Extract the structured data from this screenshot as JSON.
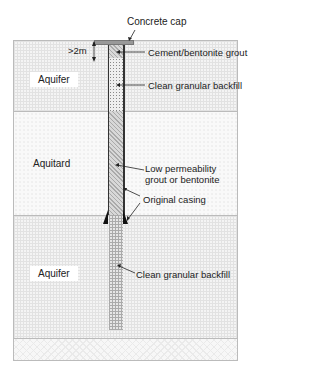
{
  "diagram": {
    "type": "borehole decommissioning cross-section",
    "layers": [
      {
        "name": "Aquifer",
        "position": "upper"
      },
      {
        "name": "Aquitard",
        "position": "middle"
      },
      {
        "name": "Aquifer",
        "position": "lower"
      }
    ],
    "labels": {
      "concrete_cap": "Concrete cap",
      "depth": ">2m",
      "cement_grout": "Cement/bentonite grout",
      "backfill_upper": "Clean granular backfill",
      "low_perm_line1": "Low permeability",
      "low_perm_line2": "grout or bentonite",
      "original_casing": "Original casing",
      "backfill_lower": "Clean granular backfill"
    },
    "colors": {
      "line": "#222222",
      "casing": "#333333",
      "frame": "#bbbbbb"
    }
  }
}
